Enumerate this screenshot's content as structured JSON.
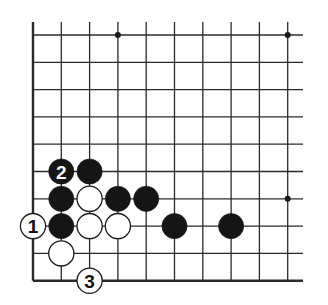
{
  "diagram": {
    "type": "go-board-fragment",
    "grid": {
      "origin_x": 33,
      "origin_y": 35,
      "spacing_x": 28.3,
      "spacing_y": 27.3,
      "columns": 10,
      "rows": 10,
      "line_color": "#2a2a2a",
      "edges": [
        "left",
        "bottom"
      ]
    },
    "star_points": [
      {
        "col": 3,
        "row": 0
      },
      {
        "col": 9,
        "row": 0
      },
      {
        "col": 9,
        "row": 6
      }
    ],
    "stones": [
      {
        "color": "black",
        "col": 1,
        "row": 5,
        "label": "2"
      },
      {
        "color": "black",
        "col": 2,
        "row": 5,
        "label": ""
      },
      {
        "color": "black",
        "col": 1,
        "row": 6,
        "label": ""
      },
      {
        "color": "white",
        "col": 2,
        "row": 6,
        "label": ""
      },
      {
        "color": "black",
        "col": 3,
        "row": 6,
        "label": ""
      },
      {
        "color": "black",
        "col": 4,
        "row": 6,
        "label": ""
      },
      {
        "color": "white",
        "col": 0,
        "row": 7,
        "label": "1"
      },
      {
        "color": "black",
        "col": 1,
        "row": 7,
        "label": ""
      },
      {
        "color": "white",
        "col": 2,
        "row": 7,
        "label": ""
      },
      {
        "color": "white",
        "col": 3,
        "row": 7,
        "label": ""
      },
      {
        "color": "black",
        "col": 5,
        "row": 7,
        "label": ""
      },
      {
        "color": "black",
        "col": 7,
        "row": 7,
        "label": ""
      },
      {
        "color": "white",
        "col": 1,
        "row": 8,
        "label": ""
      },
      {
        "color": "white",
        "col": 2,
        "row": 9,
        "label": "3"
      }
    ],
    "colors": {
      "black_stone": "#151515",
      "white_stone": "#ffffff",
      "stone_outline": "#1a1a1a",
      "background": "#ffffff"
    }
  }
}
